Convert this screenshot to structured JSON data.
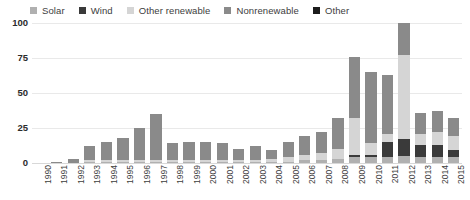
{
  "legend": {
    "position": "top-left",
    "items": [
      {
        "label": "Solar",
        "color": "#b0b0b0",
        "key": "solar"
      },
      {
        "label": "Wind",
        "color": "#3a3a3a",
        "key": "wind"
      },
      {
        "label": "Other renewable",
        "color": "#d5d5d5",
        "key": "other_renewable"
      },
      {
        "label": "Nonrenewable",
        "color": "#8a8a8a",
        "key": "nonrenewable"
      },
      {
        "label": "Other",
        "color": "#1c1c1c",
        "key": "other"
      }
    ]
  },
  "axes": {
    "y_ticks": [
      "0",
      "25",
      "50",
      "75",
      "100"
    ],
    "y_tick_values": [
      0,
      25,
      50,
      75,
      100
    ],
    "ylim": [
      0,
      100
    ],
    "grid": true
  },
  "chart_data": {
    "type": "bar",
    "stacked": true,
    "title": "",
    "subtitle": "",
    "xlabel": "",
    "ylabel": "",
    "ylim": [
      0,
      100
    ],
    "grid": true,
    "legend_position": "top-left",
    "categories": [
      "1990",
      "1991",
      "1992",
      "1993",
      "1994",
      "1995",
      "1996",
      "1997",
      "1998",
      "1999",
      "2000",
      "2001",
      "2002",
      "2003",
      "2004",
      "2005",
      "2006",
      "2007",
      "2008",
      "2009",
      "2010",
      "2011",
      "2012",
      "2013",
      "2014",
      "2015"
    ],
    "series": [
      {
        "name": "Solar",
        "color": "#b0b0b0",
        "values": [
          0,
          0,
          0,
          1,
          1,
          1,
          1,
          1,
          1,
          1,
          1,
          1,
          1,
          1,
          1,
          1,
          2,
          2,
          3,
          4,
          4,
          4,
          5,
          4,
          4,
          4
        ]
      },
      {
        "name": "Wind",
        "color": "#3a3a3a",
        "values": [
          0,
          0,
          0,
          0,
          0,
          0,
          0,
          0,
          0,
          0,
          0,
          0,
          0,
          0,
          0,
          0,
          0,
          0,
          0,
          2,
          2,
          11,
          12,
          9,
          9,
          5
        ]
      },
      {
        "name": "Other renewable",
        "color": "#d5d5d5",
        "values": [
          0,
          0,
          0,
          1,
          1,
          1,
          1,
          1,
          1,
          1,
          1,
          1,
          1,
          1,
          2,
          3,
          4,
          5,
          7,
          26,
          8,
          6,
          60,
          8,
          9,
          10
        ]
      },
      {
        "name": "Nonrenewable",
        "color": "#8a8a8a",
        "values": [
          0,
          1,
          3,
          10,
          13,
          16,
          23,
          33,
          12,
          13,
          13,
          12,
          8,
          10,
          6,
          11,
          13,
          15,
          22,
          44,
          51,
          42,
          23,
          15,
          15,
          13
        ]
      },
      {
        "name": "Other",
        "color": "#1c1c1c",
        "values": [
          0,
          0,
          0,
          0,
          0,
          0,
          0,
          0,
          0,
          0,
          0,
          0,
          0,
          0,
          0,
          0,
          0,
          0,
          0,
          0,
          0,
          0,
          0,
          0,
          0,
          0
        ]
      }
    ],
    "totals": [
      0,
      1,
      3,
      12,
      15,
      18,
      25,
      35,
      14,
      15,
      15,
      14,
      10,
      12,
      9,
      15,
      19,
      22,
      32,
      76,
      65,
      63,
      100,
      36,
      37,
      32
    ]
  }
}
